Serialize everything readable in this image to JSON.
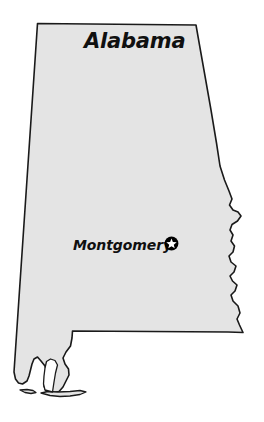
{
  "map": {
    "title": "Alabama",
    "type": "state-outline-map",
    "fill_color": "#e4e4e4",
    "outline_color": "#1a1a1a",
    "background_color": "#ffffff",
    "label_color": "#101010",
    "features": [
      {
        "name": "Montgomery",
        "role": "state-capital",
        "marker": "star-in-circle",
        "marker_fill": "#000000",
        "star_fill": "#ffffff"
      }
    ]
  }
}
